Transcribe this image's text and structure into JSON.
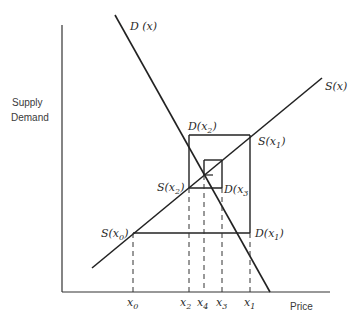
{
  "diagram": {
    "y_axis_label_line1": "Supply",
    "y_axis_label_line2": "Demand",
    "x_axis_label": "Price",
    "curves": {
      "demand": "D (x)",
      "supply": "S(x)"
    },
    "points": {
      "S_x0": {
        "base": "S(",
        "var": "x",
        "sub": "0",
        "close": ")"
      },
      "D_x1": {
        "base": "D(",
        "var": "x",
        "sub": "1",
        "close": ")"
      },
      "S_x1": {
        "base": "S(",
        "var": "x",
        "sub": "1",
        "close": ")"
      },
      "D_x2": {
        "base": "D(",
        "var": "x",
        "sub": "2",
        "close": ")"
      },
      "S_x2": {
        "base": "S(",
        "var": "x",
        "sub": "2",
        "close": ")"
      },
      "D_x3": {
        "base": "D(",
        "var": "x",
        "sub": "3",
        "close": ""
      }
    },
    "ticks": [
      {
        "var": "x",
        "sub": "0"
      },
      {
        "var": "x",
        "sub": "2"
      },
      {
        "var": "x",
        "sub": "4"
      },
      {
        "var": "x",
        "sub": "3"
      },
      {
        "var": "x",
        "sub": "1"
      }
    ],
    "line_color": "#222222"
  }
}
